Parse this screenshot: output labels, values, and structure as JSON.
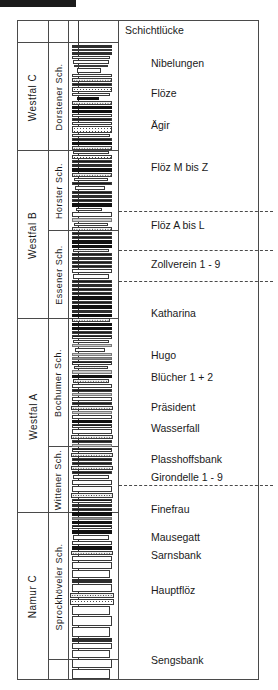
{
  "diagram": {
    "type": "stratigraphic-column",
    "top_note": "Schichtlücke"
  },
  "columns": {
    "stage_header": "",
    "member_header": "",
    "lithology_header": "",
    "labels_header": ""
  },
  "stages": [
    {
      "label": "Westfal C",
      "top": 22,
      "height": 108
    },
    {
      "label": "Westfal B",
      "top": 130,
      "height": 168
    },
    {
      "label": "Westfal A",
      "top": 298,
      "height": 194
    },
    {
      "label": "Namur C",
      "top": 492,
      "height": 167
    }
  ],
  "members": [
    {
      "label": "Dorstener Sch.",
      "top": 22,
      "height": 108
    },
    {
      "label": "Horster Sch.",
      "top": 130,
      "height": 80
    },
    {
      "label": "Essener Sch.",
      "top": 210,
      "height": 88
    },
    {
      "label": "Bochumer Sch.",
      "top": 298,
      "height": 128
    },
    {
      "label": "Wittener Sch.",
      "top": 426,
      "height": 66
    },
    {
      "label": "Sprockhöveler Sch.",
      "top": 492,
      "height": 147
    }
  ],
  "seams": [
    {
      "label": "Schichtlücke",
      "top": 5
    },
    {
      "label": "Nibelungen",
      "top": 38
    },
    {
      "label": "Flöze",
      "top": 68
    },
    {
      "label": "Ägir",
      "top": 100
    },
    {
      "label": "Flöz M bis Z",
      "top": 142
    },
    {
      "label": "Flöz A bis L",
      "top": 200
    },
    {
      "label": "Zollverein 1 - 9",
      "top": 239
    },
    {
      "label": "Katharina",
      "top": 288
    },
    {
      "label": "Hugo",
      "top": 330
    },
    {
      "label": "Blücher 1 + 2",
      "top": 352
    },
    {
      "label": "Präsident",
      "top": 382
    },
    {
      "label": "Wasserfall",
      "top": 403
    },
    {
      "label": "Plasshoffsbank",
      "top": 434
    },
    {
      "label": "Girondelle 1 - 9",
      "top": 452
    },
    {
      "label": "Finefrau",
      "top": 484
    },
    {
      "label": "Mausegatt",
      "top": 512
    },
    {
      "label": "Sarnsbank",
      "top": 530
    },
    {
      "label": "Hauptflöz",
      "top": 565
    },
    {
      "label": "Sengsbank",
      "top": 635
    }
  ],
  "correlation_lines": [
    {
      "top": 190
    },
    {
      "top": 229
    },
    {
      "top": 260
    },
    {
      "top": 464
    }
  ],
  "chart_data": {
    "type": "table",
    "xlabel": "",
    "ylabel": "Stratigraphy (top = younger)",
    "legend": [],
    "beds": [
      {
        "top": 24,
        "h": 3,
        "w": 40,
        "fill": "f-dark"
      },
      {
        "top": 28,
        "h": 2,
        "w": 40,
        "fill": "f-white"
      },
      {
        "top": 31,
        "h": 3,
        "w": 40,
        "fill": "f-dark"
      },
      {
        "top": 35,
        "h": 3,
        "w": 38,
        "fill": "f-white"
      },
      {
        "top": 39,
        "h": 4,
        "w": 36,
        "fill": "f-white"
      },
      {
        "top": 44,
        "h": 2,
        "w": 34,
        "fill": "f-white"
      },
      {
        "top": 47,
        "h": 5,
        "w": 24,
        "fill": "f-white"
      },
      {
        "top": 53,
        "h": 3,
        "w": 40,
        "fill": "f-white"
      },
      {
        "top": 57,
        "h": 4,
        "w": 40,
        "fill": "f-dots2"
      },
      {
        "top": 62,
        "h": 3,
        "w": 40,
        "fill": "f-hatch"
      },
      {
        "top": 66,
        "h": 5,
        "w": 40,
        "fill": "f-stipple"
      },
      {
        "top": 72,
        "h": 3,
        "w": 38,
        "fill": "f-white"
      },
      {
        "top": 76,
        "h": 3,
        "w": 22,
        "fill": "f-black"
      },
      {
        "top": 80,
        "h": 4,
        "w": 40,
        "fill": "f-dots2"
      },
      {
        "top": 85,
        "h": 3,
        "w": 40,
        "fill": "f-black"
      },
      {
        "top": 89,
        "h": 3,
        "w": 40,
        "fill": "f-black"
      },
      {
        "top": 93,
        "h": 3,
        "w": 40,
        "fill": "f-white"
      },
      {
        "top": 97,
        "h": 3,
        "w": 40,
        "fill": "f-hatch"
      },
      {
        "top": 101,
        "h": 3,
        "w": 40,
        "fill": "f-white"
      },
      {
        "top": 105,
        "h": 7,
        "w": 40,
        "fill": "f-stipple"
      },
      {
        "top": 113,
        "h": 3,
        "w": 38,
        "fill": "f-white"
      },
      {
        "top": 117,
        "h": 3,
        "w": 40,
        "fill": "f-hatch"
      },
      {
        "top": 121,
        "h": 3,
        "w": 40,
        "fill": "f-black"
      },
      {
        "top": 125,
        "h": 4,
        "w": 40,
        "fill": "f-dots2"
      },
      {
        "top": 130,
        "h": 3,
        "w": 36,
        "fill": "f-white"
      },
      {
        "top": 134,
        "h": 4,
        "w": 40,
        "fill": "f-stipple"
      },
      {
        "top": 139,
        "h": 3,
        "w": 40,
        "fill": "f-hatch"
      },
      {
        "top": 143,
        "h": 3,
        "w": 40,
        "fill": "f-dark"
      },
      {
        "top": 147,
        "h": 4,
        "w": 40,
        "fill": "f-black"
      },
      {
        "top": 152,
        "h": 4,
        "w": 40,
        "fill": "f-dots2"
      },
      {
        "top": 157,
        "h": 3,
        "w": 34,
        "fill": "f-white"
      },
      {
        "top": 161,
        "h": 3,
        "w": 40,
        "fill": "f-hatch"
      },
      {
        "top": 165,
        "h": 4,
        "w": 30,
        "fill": "f-white"
      },
      {
        "top": 170,
        "h": 3,
        "w": 40,
        "fill": "f-hatch"
      },
      {
        "top": 174,
        "h": 3,
        "w": 40,
        "fill": "f-dark"
      },
      {
        "top": 178,
        "h": 3,
        "w": 40,
        "fill": "f-hatch"
      },
      {
        "top": 182,
        "h": 4,
        "w": 40,
        "fill": "f-black"
      },
      {
        "top": 187,
        "h": 3,
        "w": 26,
        "fill": "f-white"
      },
      {
        "top": 191,
        "h": 5,
        "w": 40,
        "fill": "f-white"
      },
      {
        "top": 197,
        "h": 4,
        "w": 40,
        "fill": "f-lgray"
      },
      {
        "top": 202,
        "h": 3,
        "w": 34,
        "fill": "f-white"
      },
      {
        "top": 206,
        "h": 4,
        "w": 40,
        "fill": "f-dots2"
      },
      {
        "top": 211,
        "h": 3,
        "w": 40,
        "fill": "f-hatch"
      },
      {
        "top": 215,
        "h": 3,
        "w": 40,
        "fill": "f-hatch"
      },
      {
        "top": 219,
        "h": 4,
        "w": 40,
        "fill": "f-black"
      },
      {
        "top": 224,
        "h": 3,
        "w": 40,
        "fill": "f-black"
      },
      {
        "top": 228,
        "h": 3,
        "w": 36,
        "fill": "f-dots2"
      },
      {
        "top": 232,
        "h": 3,
        "w": 40,
        "fill": "f-hatch"
      },
      {
        "top": 236,
        "h": 3,
        "w": 40,
        "fill": "f-dark"
      },
      {
        "top": 240,
        "h": 3,
        "w": 40,
        "fill": "f-hatch"
      },
      {
        "top": 244,
        "h": 3,
        "w": 40,
        "fill": "f-hatch"
      },
      {
        "top": 248,
        "h": 4,
        "w": 40,
        "fill": "f-white"
      },
      {
        "top": 253,
        "h": 5,
        "w": 36,
        "fill": "f-white"
      },
      {
        "top": 259,
        "h": 3,
        "w": 40,
        "fill": "f-hatch"
      },
      {
        "top": 263,
        "h": 3,
        "w": 40,
        "fill": "f-dark"
      },
      {
        "top": 267,
        "h": 3,
        "w": 40,
        "fill": "f-hatch"
      },
      {
        "top": 271,
        "h": 3,
        "w": 40,
        "fill": "f-hatch"
      },
      {
        "top": 275,
        "h": 4,
        "w": 40,
        "fill": "f-black"
      },
      {
        "top": 280,
        "h": 3,
        "w": 40,
        "fill": "f-hatch"
      },
      {
        "top": 284,
        "h": 4,
        "w": 40,
        "fill": "f-black"
      },
      {
        "top": 289,
        "h": 3,
        "w": 40,
        "fill": "f-dark"
      },
      {
        "top": 293,
        "h": 3,
        "w": 40,
        "fill": "f-black"
      },
      {
        "top": 297,
        "h": 4,
        "w": 38,
        "fill": "f-dots2"
      },
      {
        "top": 302,
        "h": 3,
        "w": 40,
        "fill": "f-black"
      },
      {
        "top": 306,
        "h": 3,
        "w": 40,
        "fill": "f-black"
      },
      {
        "top": 310,
        "h": 3,
        "w": 40,
        "fill": "f-hatch"
      },
      {
        "top": 314,
        "h": 4,
        "w": 40,
        "fill": "f-hatch"
      },
      {
        "top": 319,
        "h": 3,
        "w": 36,
        "fill": "f-white"
      },
      {
        "top": 323,
        "h": 3,
        "w": 40,
        "fill": "f-lgray"
      },
      {
        "top": 327,
        "h": 4,
        "w": 30,
        "fill": "f-white"
      },
      {
        "top": 332,
        "h": 3,
        "w": 40,
        "fill": "f-lgray"
      },
      {
        "top": 336,
        "h": 3,
        "w": 40,
        "fill": "f-gray"
      },
      {
        "top": 340,
        "h": 4,
        "w": 40,
        "fill": "f-hatch"
      },
      {
        "top": 345,
        "h": 3,
        "w": 34,
        "fill": "f-dots2"
      },
      {
        "top": 349,
        "h": 4,
        "w": 40,
        "fill": "f-lgray"
      },
      {
        "top": 354,
        "h": 3,
        "w": 40,
        "fill": "f-black"
      },
      {
        "top": 358,
        "h": 4,
        "w": 36,
        "fill": "f-dots2"
      },
      {
        "top": 363,
        "h": 4,
        "w": 40,
        "fill": "f-white"
      },
      {
        "top": 368,
        "h": 3,
        "w": 40,
        "fill": "f-hatch"
      },
      {
        "top": 372,
        "h": 3,
        "w": 40,
        "fill": "f-lgray"
      },
      {
        "top": 376,
        "h": 4,
        "w": 40,
        "fill": "f-white"
      },
      {
        "top": 381,
        "h": 3,
        "w": 40,
        "fill": "f-hatch"
      },
      {
        "top": 385,
        "h": 4,
        "w": 42,
        "fill": "f-dots2"
      },
      {
        "top": 390,
        "h": 3,
        "w": 40,
        "fill": "f-lgray"
      },
      {
        "top": 394,
        "h": 4,
        "w": 40,
        "fill": "f-white"
      },
      {
        "top": 399,
        "h": 3,
        "w": 40,
        "fill": "f-black"
      },
      {
        "top": 403,
        "h": 4,
        "w": 40,
        "fill": "f-hatch"
      },
      {
        "top": 408,
        "h": 5,
        "w": 40,
        "fill": "f-white"
      },
      {
        "top": 414,
        "h": 4,
        "w": 42,
        "fill": "f-dots2"
      },
      {
        "top": 419,
        "h": 3,
        "w": 40,
        "fill": "f-hatch"
      },
      {
        "top": 423,
        "h": 3,
        "w": 40,
        "fill": "f-lgray"
      },
      {
        "top": 427,
        "h": 4,
        "w": 40,
        "fill": "f-hatch"
      },
      {
        "top": 432,
        "h": 4,
        "w": 42,
        "fill": "f-dots2"
      },
      {
        "top": 437,
        "h": 3,
        "w": 40,
        "fill": "f-hatch"
      },
      {
        "top": 441,
        "h": 3,
        "w": 40,
        "fill": "f-hatch"
      },
      {
        "top": 445,
        "h": 4,
        "w": 42,
        "fill": "f-dots2"
      },
      {
        "top": 450,
        "h": 3,
        "w": 40,
        "fill": "f-hatch"
      },
      {
        "top": 454,
        "h": 4,
        "w": 36,
        "fill": "f-white"
      },
      {
        "top": 459,
        "h": 5,
        "w": 40,
        "fill": "f-white"
      },
      {
        "top": 465,
        "h": 6,
        "w": 40,
        "fill": "f-white"
      },
      {
        "top": 472,
        "h": 5,
        "w": 42,
        "fill": "f-dots2"
      },
      {
        "top": 478,
        "h": 4,
        "w": 40,
        "fill": "f-hatch"
      },
      {
        "top": 483,
        "h": 3,
        "w": 40,
        "fill": "f-dark"
      },
      {
        "top": 487,
        "h": 3,
        "w": 40,
        "fill": "f-hatch"
      },
      {
        "top": 491,
        "h": 4,
        "w": 40,
        "fill": "f-black"
      },
      {
        "top": 496,
        "h": 3,
        "w": 40,
        "fill": "f-gray"
      },
      {
        "top": 500,
        "h": 3,
        "w": 40,
        "fill": "f-black"
      },
      {
        "top": 504,
        "h": 4,
        "w": 40,
        "fill": "f-hatch"
      },
      {
        "top": 509,
        "h": 4,
        "w": 40,
        "fill": "f-black"
      },
      {
        "top": 514,
        "h": 5,
        "w": 36,
        "fill": "f-white"
      },
      {
        "top": 520,
        "h": 4,
        "w": 40,
        "fill": "f-white"
      },
      {
        "top": 525,
        "h": 4,
        "w": 40,
        "fill": "f-black"
      },
      {
        "top": 530,
        "h": 4,
        "w": 42,
        "fill": "f-dots2"
      },
      {
        "top": 535,
        "h": 5,
        "w": 40,
        "fill": "f-white"
      },
      {
        "top": 541,
        "h": 7,
        "w": 40,
        "fill": "f-white"
      },
      {
        "top": 549,
        "h": 8,
        "w": 38,
        "fill": "f-white"
      },
      {
        "top": 558,
        "h": 4,
        "w": 40,
        "fill": "f-dark"
      },
      {
        "top": 563,
        "h": 8,
        "w": 40,
        "fill": "f-white"
      },
      {
        "top": 572,
        "h": 5,
        "w": 44,
        "fill": "f-dots2"
      },
      {
        "top": 578,
        "h": 6,
        "w": 44,
        "fill": "f-stipple"
      },
      {
        "top": 585,
        "h": 9,
        "w": 38,
        "fill": "f-white"
      },
      {
        "top": 595,
        "h": 10,
        "w": 40,
        "fill": "f-white"
      },
      {
        "top": 606,
        "h": 10,
        "w": 38,
        "fill": "f-white"
      },
      {
        "top": 617,
        "h": 4,
        "w": 40,
        "fill": "f-dark"
      },
      {
        "top": 622,
        "h": 6,
        "w": 40,
        "fill": "f-white"
      },
      {
        "top": 629,
        "h": 8,
        "w": 38,
        "fill": "f-white"
      },
      {
        "top": 638,
        "h": 9,
        "w": 40,
        "fill": "f-white"
      },
      {
        "top": 648,
        "h": 10,
        "w": 38,
        "fill": "f-white"
      }
    ]
  }
}
